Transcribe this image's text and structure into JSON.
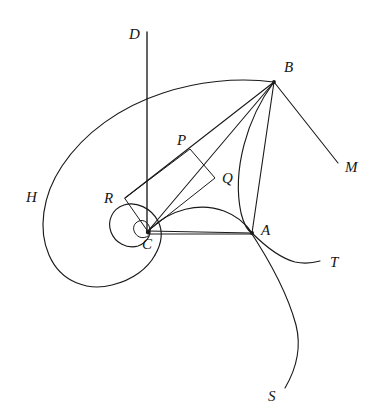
{
  "figure": {
    "background_color": "#ffffff",
    "ink_color": "#1a1a1a",
    "width": 371,
    "height": 414
  },
  "labels": {
    "D": {
      "text": "D",
      "x": 129,
      "y": 39
    },
    "B": {
      "text": "B",
      "x": 284,
      "y": 72
    },
    "M": {
      "text": "M",
      "x": 345,
      "y": 172
    },
    "P": {
      "text": "P",
      "x": 177,
      "y": 145
    },
    "Q": {
      "text": "Q",
      "x": 222,
      "y": 183
    },
    "H": {
      "text": "H",
      "x": 26,
      "y": 202
    },
    "R": {
      "text": "R",
      "x": 104,
      "y": 203
    },
    "A": {
      "text": "A",
      "x": 261,
      "y": 235
    },
    "C": {
      "text": "C",
      "x": 142,
      "y": 249
    },
    "T": {
      "text": "T",
      "x": 330,
      "y": 267
    },
    "S": {
      "text": "S",
      "x": 268,
      "y": 401
    }
  },
  "points": {
    "A": {
      "x": 252,
      "y": 233
    },
    "B": {
      "x": 274,
      "y": 82
    },
    "C": {
      "x": 147,
      "y": 232
    },
    "P": {
      "x": 190,
      "y": 149
    },
    "Q": {
      "x": 215,
      "y": 178
    },
    "R": {
      "x": 125,
      "y": 198
    }
  },
  "geometry": {
    "axis_D": {
      "name": "vertical-axis-D",
      "x": 147,
      "y_top": 32,
      "y_bottom": 233
    },
    "ray_M": {
      "name": "ray-BM",
      "x1": 274,
      "y1": 82,
      "x2": 338,
      "y2": 163
    },
    "segment_CA": {
      "name": "segment-CA",
      "x1": 147,
      "y1": 233,
      "x2": 252,
      "y2": 233
    },
    "segment_BA": {
      "name": "chord-BA",
      "x1": 274,
      "y1": 82,
      "x2": 252,
      "y2": 233
    },
    "segment_BC": {
      "name": "segment-BC",
      "x1": 274,
      "y1": 82,
      "x2": 147,
      "y2": 232
    },
    "segment_BR": {
      "name": "segment-BR-through-P",
      "x1": 274,
      "y1": 82,
      "x2": 125,
      "y2": 198
    },
    "segment_AQ_C": {
      "name": "segment-AC-through-Q",
      "x1": 252,
      "y1": 233,
      "x2": 147,
      "y2": 232
    },
    "parallelogram_RPQC": {
      "name": "parallelogram-R-P-Q-C",
      "vertices": [
        {
          "x": 125,
          "y": 198
        },
        {
          "x": 190,
          "y": 149
        },
        {
          "x": 215,
          "y": 178
        },
        {
          "x": 147,
          "y": 231
        }
      ]
    },
    "arc_BA": {
      "name": "arc-B-to-A",
      "from": "B",
      "to": "A",
      "bulge": "left"
    },
    "arc_CA": {
      "name": "arc-C-to-A",
      "from": "C",
      "to": "A",
      "bulge": "up"
    },
    "curve_T": {
      "name": "tangent-curve-T",
      "from": "A",
      "to_x": 320,
      "to_y": 261
    },
    "curve_S": {
      "name": "spiral-curve-S",
      "from": "A",
      "to_x": 285,
      "to_y": 388
    },
    "spiral_H": {
      "name": "logarithmic-spiral-H",
      "center": "C",
      "turns": 2
    }
  }
}
